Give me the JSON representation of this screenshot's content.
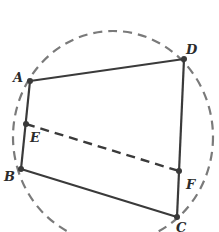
{
  "figure": {
    "type": "geometry",
    "colors": {
      "solid": "#3a3a3a",
      "dashed": "#7a7a7a",
      "point": "#3a3a3a",
      "label": "#2b2b2b"
    },
    "circle": {
      "cx": 113,
      "cy": 137,
      "rx": 100,
      "ry": 106,
      "style": "dashed"
    },
    "points": {
      "A": {
        "label": "A",
        "x": 30,
        "y": 81
      },
      "B": {
        "label": "B",
        "x": 21,
        "y": 169
      },
      "C": {
        "label": "C",
        "x": 177,
        "y": 217
      },
      "D": {
        "label": "D",
        "x": 184,
        "y": 59
      },
      "E": {
        "label": "E",
        "x": 26,
        "y": 124
      },
      "F": {
        "label": "F",
        "x": 179,
        "y": 171
      }
    },
    "segments": [
      {
        "from": "A",
        "to": "D",
        "style": "solid"
      },
      {
        "from": "D",
        "to": "C",
        "style": "solid"
      },
      {
        "from": "C",
        "to": "B",
        "style": "solid"
      },
      {
        "from": "B",
        "to": "A",
        "style": "solid"
      },
      {
        "from": "E",
        "to": "F",
        "style": "dashed"
      }
    ]
  }
}
